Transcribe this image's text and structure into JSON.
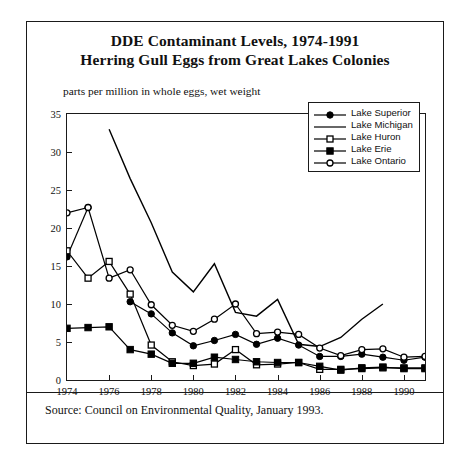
{
  "figure": {
    "title_line1": "DDE Contaminant Levels, 1974-1991",
    "title_line2": "Herring Gull Eggs from Great Lakes Colonies",
    "axis_note": "parts per million in whole eggs, wet weight",
    "source": "Source: Council on Environmental Quality, January 1993."
  },
  "legend": {
    "items": [
      {
        "label": "Lake Superior",
        "marker": "filled-circle"
      },
      {
        "label": "Lake Michigan",
        "marker": "none"
      },
      {
        "label": "Lake Huron",
        "marker": "open-square"
      },
      {
        "label": "Lake Erie",
        "marker": "filled-square"
      },
      {
        "label": "Lake Ontario",
        "marker": "open-circle"
      }
    ]
  },
  "chart_data": {
    "type": "line",
    "subtitle": "parts per million in whole eggs, wet weight",
    "xlabel": "",
    "ylabel": "parts per million in whole eggs, wet weight",
    "x": [
      1974,
      1975,
      1976,
      1977,
      1978,
      1979,
      1980,
      1981,
      1982,
      1983,
      1984,
      1985,
      1986,
      1987,
      1988,
      1989,
      1990,
      1991
    ],
    "xlim": [
      1974,
      1991
    ],
    "ylim": [
      0,
      35
    ],
    "yticks": [
      0,
      5,
      10,
      15,
      20,
      25,
      30,
      35
    ],
    "xticks": [
      1974,
      1976,
      1978,
      1980,
      1982,
      1984,
      1986,
      1988,
      1990
    ],
    "xticklabels": [
      "1974",
      "1976",
      "1978",
      "1980",
      "1982",
      "1984",
      "1986",
      "1988",
      "1990"
    ],
    "grid": false,
    "legend_position": "upper right",
    "series": [
      {
        "name": "Lake Superior",
        "marker": "filled-circle",
        "values": [
          16.2,
          22.7,
          null,
          10.3,
          8.7,
          6.2,
          4.5,
          5.2,
          6.0,
          4.7,
          5.5,
          4.6,
          3.1,
          3.1,
          3.4,
          3.0,
          2.6,
          3.0
        ]
      },
      {
        "name": "Lake Michigan",
        "marker": "none",
        "values": [
          null,
          null,
          33.0,
          26.5,
          20.7,
          14.2,
          11.6,
          15.3,
          8.9,
          8.4,
          10.6,
          4.7,
          4.4,
          5.6,
          8.0,
          10.0,
          null,
          null
        ]
      },
      {
        "name": "Lake Huron",
        "marker": "open-square",
        "values": [
          17.0,
          13.4,
          15.6,
          11.3,
          4.6,
          2.4,
          1.9,
          2.1,
          4.0,
          2.0,
          2.1,
          2.3,
          1.4,
          1.4,
          1.5,
          1.6,
          1.6,
          1.6
        ]
      },
      {
        "name": "Lake Erie",
        "marker": "filled-square",
        "values": [
          6.8,
          6.9,
          7.0,
          4.0,
          3.4,
          2.2,
          2.2,
          3.0,
          2.7,
          2.4,
          2.3,
          2.3,
          1.8,
          1.3,
          1.6,
          1.7,
          1.5,
          1.5
        ]
      },
      {
        "name": "Lake Ontario",
        "marker": "open-circle",
        "values": [
          22.0,
          22.7,
          13.4,
          14.5,
          9.9,
          7.2,
          6.4,
          8.0,
          10.0,
          6.1,
          6.3,
          6.0,
          4.2,
          3.2,
          4.0,
          4.1,
          3.0,
          3.1
        ]
      }
    ]
  }
}
